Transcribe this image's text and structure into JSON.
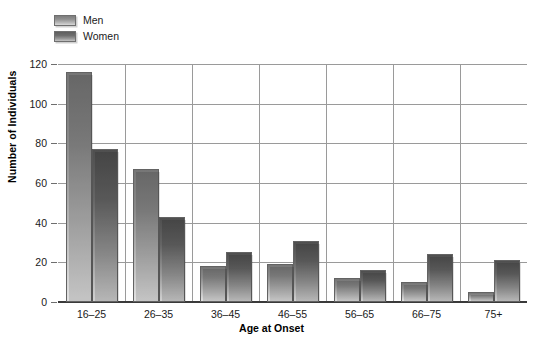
{
  "chart_data": {
    "type": "bar",
    "title": "",
    "xlabel": "Age at Onset",
    "ylabel": "Number of Individuals",
    "categories": [
      "16–25",
      "26–35",
      "36–45",
      "46–55",
      "56–65",
      "66–75",
      "75+"
    ],
    "series": [
      {
        "name": "Men",
        "values": [
          116,
          67,
          18,
          19,
          12,
          10,
          5
        ],
        "color": "#8a8a8a"
      },
      {
        "name": "Women",
        "values": [
          77,
          43,
          25,
          31,
          16,
          24,
          21
        ],
        "color": "#656565"
      }
    ],
    "ylim": [
      0,
      120
    ],
    "ytick_labels": [
      "0",
      "20",
      "40",
      "60",
      "80",
      "100",
      "120"
    ],
    "ytick_values": [
      0,
      20,
      40,
      60,
      80,
      100,
      120
    ],
    "grid": true,
    "grid_axis": "y",
    "legend_position": "top-left"
  },
  "legend": {
    "items": [
      {
        "label": "Men"
      },
      {
        "label": "Women"
      }
    ]
  },
  "colors": {
    "gridline": "#9a9a9a",
    "axis": "#3a3a3a",
    "text": "#1a1a1a",
    "background": "#ffffff"
  }
}
